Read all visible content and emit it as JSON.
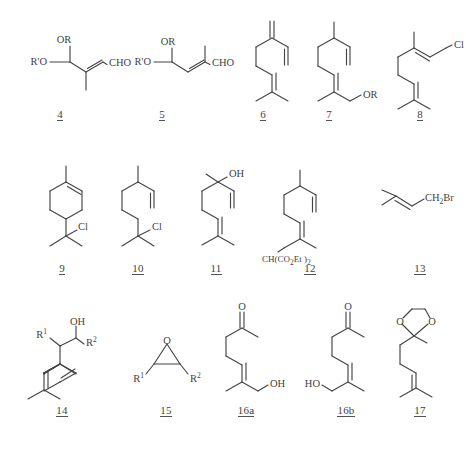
{
  "figure": {
    "type": "chemical-structure-grid",
    "width": 466,
    "height": 452,
    "background": "#ffffff",
    "line_color": "#454545",
    "text_color": "#3f3f3f",
    "rows": 3,
    "columns": 5
  },
  "compounds": [
    {
      "id": "4",
      "label": "4",
      "row": 1,
      "column": 1,
      "name": "2-methyl-4,4-dialkoxy-but-2-enal",
      "atom_labels": [
        "OR",
        "R'O",
        "CHO"
      ]
    },
    {
      "id": "5",
      "label": "5",
      "row": 1,
      "column": 2,
      "name": "3-methyl-4,4-dialkoxy-but-2-enal",
      "atom_labels": [
        "OR",
        "R'O",
        "CHO"
      ]
    },
    {
      "id": "6",
      "label": "6",
      "row": 1,
      "column": 3,
      "name": "myrcene",
      "atom_labels": []
    },
    {
      "id": "7",
      "label": "7",
      "row": 1,
      "column": 4,
      "name": "geranyl ether",
      "atom_labels": [
        "OR"
      ]
    },
    {
      "id": "8",
      "label": "8",
      "row": 1,
      "column": 5,
      "name": "geranyl chloride",
      "atom_labels": [
        "Cl"
      ]
    },
    {
      "id": "9",
      "label": "9",
      "row": 2,
      "column": 1,
      "name": "terpinyl chloride",
      "atom_labels": [
        "Cl"
      ]
    },
    {
      "id": "10",
      "label": "10",
      "row": 2,
      "column": 2,
      "name": "linalyl chloride",
      "atom_labels": [
        "Cl"
      ]
    },
    {
      "id": "11",
      "label": "11",
      "row": 2,
      "column": 3,
      "name": "linalool",
      "atom_labels": [
        "OH"
      ]
    },
    {
      "id": "12",
      "label": "12",
      "row": 2,
      "column": 4,
      "name": "diethyl geranylmalonate",
      "atom_labels": [
        "CH(CO2Et)2"
      ],
      "atom_label_rich": {
        "prefix": "CH(CO",
        "sub1": "2",
        "mid": "Et )",
        "sub2": "2"
      }
    },
    {
      "id": "13",
      "label": "13",
      "row": 2,
      "column": 5,
      "name": "prenyl bromide",
      "atom_labels": [
        "CH2Br"
      ],
      "atom_label_rich": {
        "prefix": "CH",
        "sub1": "2",
        "mid": "Br"
      }
    },
    {
      "id": "14",
      "label": "14",
      "row": 3,
      "column": 1,
      "name": "substituted homoallylic alcohol",
      "atom_labels": [
        "R1",
        "OH",
        "R2"
      ]
    },
    {
      "id": "15",
      "label": "15",
      "row": 3,
      "column": 2,
      "name": "disubstituted epoxide",
      "atom_labels": [
        "O",
        "R1",
        "R2"
      ]
    },
    {
      "id": "16a",
      "label": "16a",
      "row": 3,
      "column": 3,
      "name": "(E)-8-hydroxy-6-methyl-6-octen-2-one",
      "atom_labels": [
        "O",
        "OH"
      ]
    },
    {
      "id": "16b",
      "label": "16b",
      "row": 3,
      "column": 4,
      "name": "(Z)-8-hydroxy-6-methyl-6-octen-2-one",
      "atom_labels": [
        "O",
        "HO"
      ]
    },
    {
      "id": "17",
      "label": "17",
      "row": 3,
      "column": 5,
      "name": "6-methyl-5-hepten-2-one ethylene ketal",
      "atom_labels": [
        "O",
        "O"
      ]
    }
  ],
  "atom_text": {
    "OR": "OR",
    "RprimeO": "R'O",
    "CHO": "CHO",
    "Cl": "Cl",
    "OH": "OH",
    "HO": "HO",
    "O": "O",
    "R": "R",
    "Br": "Br",
    "CH": "CH",
    "Et": "Et",
    "CO": "CO",
    "two": "2",
    "one": "1",
    "open_paren": "(",
    "close_paren": ")"
  }
}
